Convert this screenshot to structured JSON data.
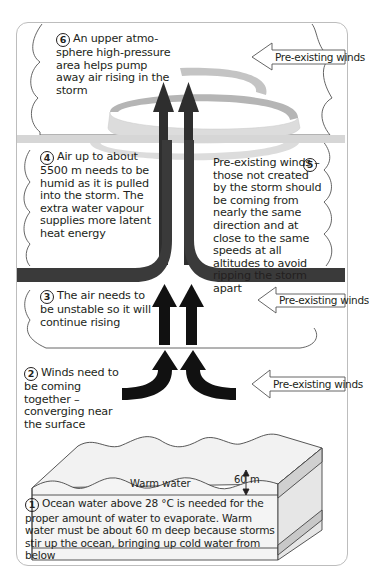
{
  "diagram": {
    "steps": [
      {
        "number": "1",
        "text": "Ocean water above 28 °C is needed for the proper amount of water to evaporate. Warm water must be about 60 m deep because storms stir up the ocean, bringing up cold water from below"
      },
      {
        "number": "2",
        "text": "Winds need to be coming together – converging near the surface"
      },
      {
        "number": "3",
        "text": "The air needs to be unstable so it will continue rising"
      },
      {
        "number": "4",
        "text": "Air up to about 5500 m needs to be humid as it is pulled into the storm. The extra water vapour supplies more latent heat energy"
      },
      {
        "number": "5",
        "text": "Pre-existing winds – those not created by the storm should be coming from nearly the same direction and at close to the same speeds at all altitudes to avoid ripping the storm apart"
      },
      {
        "number": "6",
        "text": "An upper atmo-sphere high-pressure area helps pump away air rising in the storm"
      }
    ],
    "wind_arrows": [
      {
        "label": "Pre-existing winds",
        "position": "top"
      },
      {
        "label": "Pre-existing winds",
        "position": "middle"
      },
      {
        "label": "Pre-existing winds",
        "position": "bottom"
      }
    ],
    "ocean": {
      "warm_water_label": "Warm water",
      "depth_label": "60 m"
    },
    "colors": {
      "arrow_dark": "#231f20",
      "band_dark": "#3a3a3a",
      "spiral_light": "#dcdcdc",
      "spiral_mid": "#b5b5b5",
      "outline": "#9a9a9a",
      "ocean_side": "#d0d0d0"
    }
  }
}
